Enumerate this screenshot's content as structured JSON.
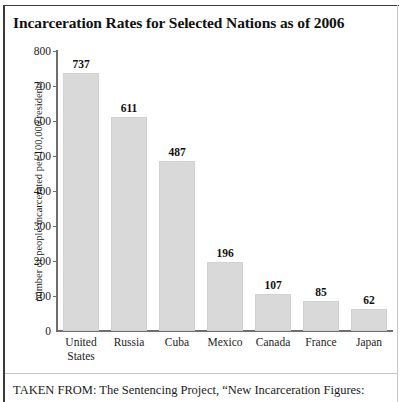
{
  "chart_data": {
    "type": "bar",
    "title": "Incarceration Rates for Selected Nations as of 2006",
    "xlabel": "",
    "ylabel": "number of people incarcerated per 100,000 residents",
    "categories": [
      "United States",
      "Russia",
      "Cuba",
      "Mexico",
      "Canada",
      "France",
      "Japan"
    ],
    "category_lines": [
      [
        "United",
        "States"
      ],
      [
        "Russia"
      ],
      [
        "Cuba"
      ],
      [
        "Mexico"
      ],
      [
        "Canada"
      ],
      [
        "France"
      ],
      [
        "Japan"
      ]
    ],
    "values": [
      737,
      611,
      487,
      196,
      107,
      85,
      62
    ],
    "value_labels": [
      "737",
      "611",
      "487",
      "196",
      "107",
      "85",
      "62"
    ],
    "ylim": [
      0,
      800
    ],
    "yticks": [
      0,
      100,
      200,
      300,
      400,
      500,
      600,
      700,
      800
    ],
    "ytick_labels": [
      "0",
      "100",
      "200",
      "300",
      "400",
      "500",
      "600",
      "700",
      "800"
    ],
    "grid": false,
    "legend": false,
    "bar_color": "#d9d9d9",
    "axis_color": "#6e6e6e",
    "text_color": "#1a1a1a"
  },
  "caption": {
    "text": "TAKEN FROM: The Sentencing Project, “New Incarceration Figures:"
  }
}
